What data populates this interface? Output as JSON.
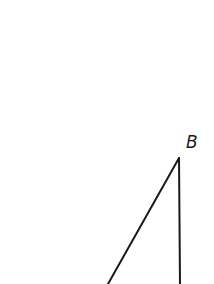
{
  "diagram": {
    "type": "geometry-triangle",
    "stroke_color": "#1a1a1a",
    "background": "#ffffff",
    "vertices": [
      {
        "label": "B",
        "x": 179,
        "y": 158,
        "label_x": 186,
        "label_y": 134
      }
    ],
    "segments": [
      {
        "name": "hypotenuse",
        "from": [
          179,
          158
        ],
        "to": [
          108,
          284
        ]
      },
      {
        "name": "vertical-side",
        "from": [
          179,
          158
        ],
        "to": [
          180,
          284
        ]
      }
    ]
  }
}
